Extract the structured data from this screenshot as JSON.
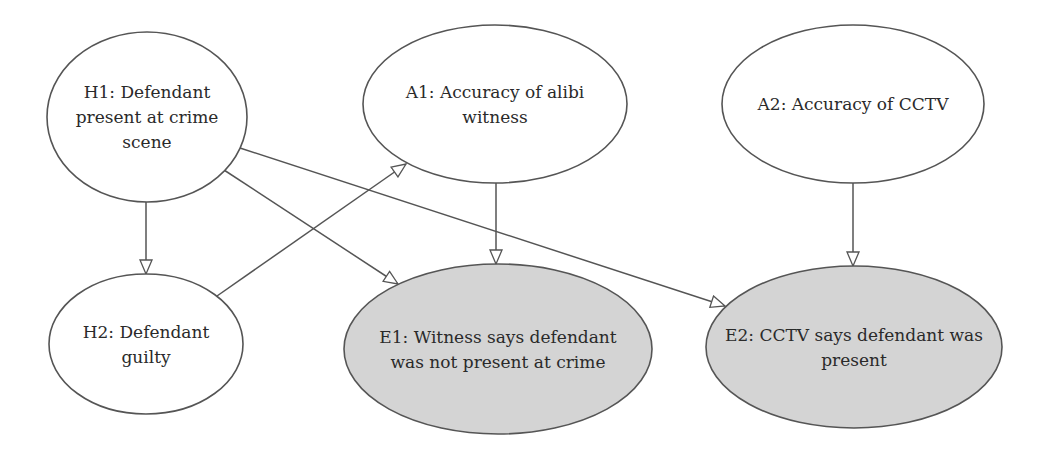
{
  "colors": {
    "stroke": "#555555",
    "node_fill": "#ffffff",
    "evidence_fill": "#d4d4d4",
    "text": "#2a2a2a",
    "background": "#ffffff"
  },
  "nodes": [
    {
      "id": "H1",
      "label_lines": [
        "H1: Defendant",
        "present at crime",
        "scene"
      ],
      "type": "hypothesis",
      "cx": 147,
      "cy": 117,
      "rx": 100,
      "ry": 85
    },
    {
      "id": "A1",
      "label_lines": [
        "A1: Accuracy of alibi",
        "witness"
      ],
      "type": "accuracy",
      "cx": 495,
      "cy": 104,
      "rx": 132,
      "ry": 79
    },
    {
      "id": "A2",
      "label_lines": [
        "A2: Accuracy of CCTV"
      ],
      "type": "accuracy",
      "cx": 853,
      "cy": 104,
      "rx": 131,
      "ry": 79
    },
    {
      "id": "H2",
      "label_lines": [
        "H2: Defendant",
        "guilty"
      ],
      "type": "hypothesis",
      "cx": 146,
      "cy": 344,
      "rx": 97,
      "ry": 70
    },
    {
      "id": "E1",
      "label_lines": [
        "E1: Witness says defendant",
        "was not present at crime"
      ],
      "type": "evidence",
      "cx": 498,
      "cy": 349,
      "rx": 154,
      "ry": 85
    },
    {
      "id": "E2",
      "label_lines": [
        "E2: CCTV says defendant was",
        "present"
      ],
      "type": "evidence",
      "cx": 854,
      "cy": 347,
      "rx": 148,
      "ry": 81
    }
  ],
  "edges": [
    {
      "from": "H1",
      "to": "H2",
      "x1": 146,
      "y1": 202,
      "x2": 146,
      "y2": 274
    },
    {
      "from": "H1",
      "to": "E1",
      "x1": 224,
      "y1": 170,
      "x2": 398,
      "y2": 284
    },
    {
      "from": "H1",
      "to": "E2",
      "x1": 240,
      "y1": 148,
      "x2": 725,
      "y2": 306
    },
    {
      "from": "H2",
      "to": "A1",
      "x1": 217,
      "y1": 296,
      "x2": 406,
      "y2": 164
    },
    {
      "from": "A1",
      "to": "E1",
      "x1": 496,
      "y1": 183,
      "x2": 496,
      "y2": 264
    },
    {
      "from": "A2",
      "to": "E2",
      "x1": 853,
      "y1": 183,
      "x2": 853,
      "y2": 266
    }
  ]
}
